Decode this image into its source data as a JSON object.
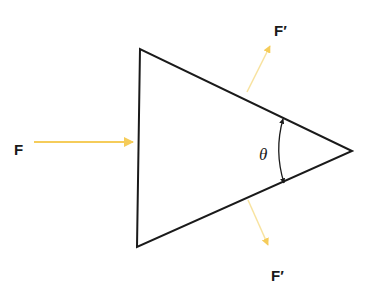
{
  "diagram": {
    "title": "",
    "labels": {
      "input_force": "F",
      "output_force_top": "F′",
      "output_force_bottom": "F′",
      "angle": "θ"
    },
    "shape": {
      "type": "triangle",
      "vertices": [
        [
          140,
          49
        ],
        [
          137,
          247
        ],
        [
          352,
          151
        ]
      ],
      "stroke": "#1a1a1a"
    },
    "arrows": [
      {
        "name": "input-force",
        "from": [
          34,
          142
        ],
        "to": [
          133,
          142
        ]
      },
      {
        "name": "output-force-top",
        "from": [
          247,
          92
        ],
        "to": [
          270,
          46
        ]
      },
      {
        "name": "output-force-bottom",
        "from": [
          248,
          200
        ],
        "to": [
          268,
          245
        ]
      }
    ],
    "colors": {
      "arrow": "#f5cc5a",
      "line": "#1a1a1a",
      "background": "#ffffff"
    }
  }
}
